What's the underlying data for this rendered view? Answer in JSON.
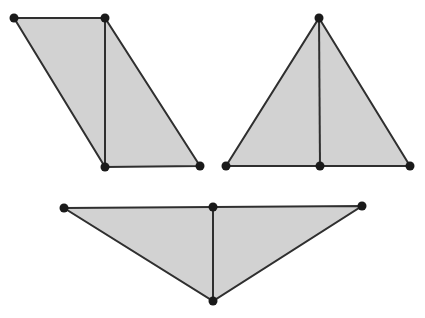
{
  "figure": {
    "canvas": {
      "width": 425,
      "height": 318,
      "background": "#ffffff"
    },
    "style": {
      "fill": "#d2d2d2",
      "stroke": "#2f2f2f",
      "stroke_width": 2,
      "vertex_color": "#1a1a1a",
      "vertex_radius": 4.5
    },
    "shapes": [
      {
        "id": "shape-parallelogram",
        "name": "parallelogram",
        "outline": "14,18 105,18 200,166 105,167",
        "divider": {
          "x1": 105,
          "y1": 18,
          "x2": 105,
          "y2": 167
        },
        "vertices": [
          {
            "name": "top-left",
            "x": 14,
            "y": 18
          },
          {
            "name": "top-right",
            "x": 105,
            "y": 18
          },
          {
            "name": "bottom-right",
            "x": 200,
            "y": 166
          },
          {
            "name": "bottom-left",
            "x": 105,
            "y": 167
          }
        ]
      },
      {
        "id": "shape-upright-triangle",
        "name": "upright triangle",
        "outline": "319,18 410,166 226,166",
        "divider": {
          "x1": 319,
          "y1": 18,
          "x2": 320,
          "y2": 166
        },
        "vertices": [
          {
            "name": "apex",
            "x": 319,
            "y": 18
          },
          {
            "name": "base-right",
            "x": 410,
            "y": 166
          },
          {
            "name": "base-middle",
            "x": 320,
            "y": 166
          },
          {
            "name": "base-left",
            "x": 226,
            "y": 166
          }
        ]
      },
      {
        "id": "shape-inverted-triangle",
        "name": "inverted triangle",
        "outline": "64,208 362,206 213,301",
        "divider": {
          "x1": 213,
          "y1": 207,
          "x2": 213,
          "y2": 301
        },
        "vertices": [
          {
            "name": "top-left",
            "x": 64,
            "y": 208
          },
          {
            "name": "top-middle",
            "x": 213,
            "y": 207
          },
          {
            "name": "top-right",
            "x": 362,
            "y": 206
          },
          {
            "name": "bottom-apex",
            "x": 213,
            "y": 301
          }
        ]
      }
    ]
  }
}
